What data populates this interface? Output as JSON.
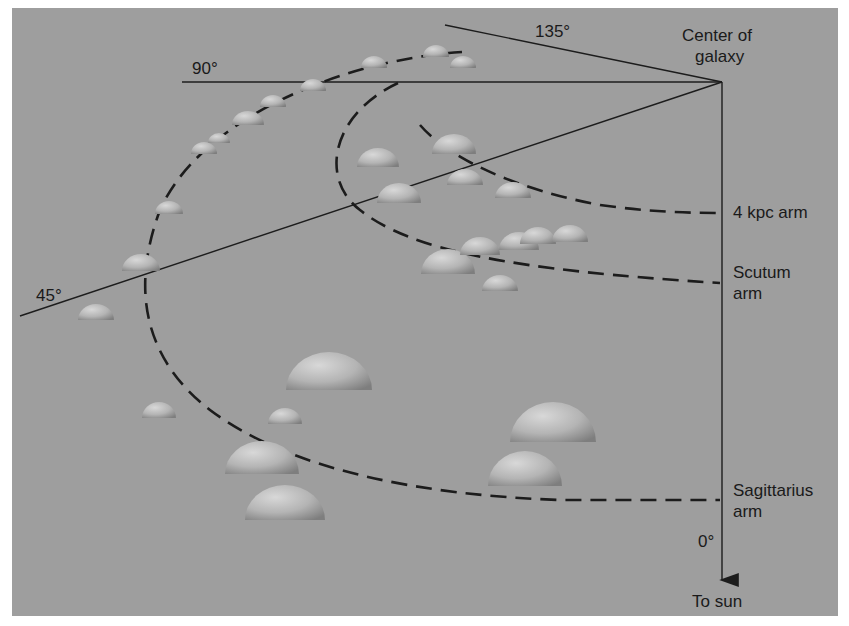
{
  "figure": {
    "background_color": "#9e9e9e",
    "center_label_line1": "Center of",
    "center_label_line2": "galaxy",
    "direction_labels": {
      "deg135": "135°",
      "deg90": "90°",
      "deg45": "45°",
      "deg0": "0°",
      "to_sun": "To sun"
    },
    "arms": [
      {
        "name": "4 kpc arm",
        "line1": "4 kpc arm",
        "line2": ""
      },
      {
        "name": "Scutum arm",
        "line1": "Scutum",
        "line2": "arm"
      },
      {
        "name": "Sagittarius arm",
        "line1": "Sagittarius",
        "line2": "arm"
      }
    ]
  }
}
